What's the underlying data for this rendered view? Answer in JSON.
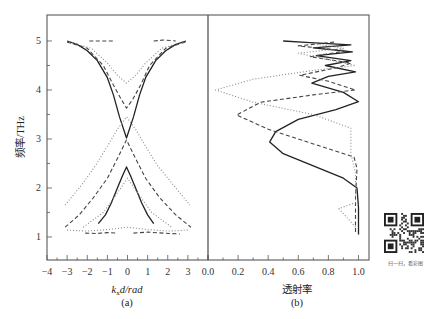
{
  "chart_data": [
    {
      "panel": "(a)",
      "type": "line",
      "title": "",
      "xlabel": "k_x d/rad",
      "xlabel_parts": {
        "k": "k",
        "sub": "x",
        "rest": "d/rad"
      },
      "ylabel": "频率/THz",
      "xlim": [
        -4,
        4
      ],
      "ylim": [
        0.53,
        5.53
      ],
      "x_ticks": [
        -4,
        -3,
        -2,
        -1,
        0,
        1,
        2,
        3
      ],
      "x_tick_labels": [
        "−4",
        "−3",
        "−2",
        "−1",
        "0",
        "1",
        "2",
        "3"
      ],
      "y_ticks": [
        1,
        2,
        3,
        4,
        5
      ],
      "y_tick_labels": [
        "1",
        "2",
        "3",
        "4",
        "5"
      ],
      "grid": false,
      "legend": null,
      "series": [
        {
          "name": "solid-upper-band",
          "style": "solid",
          "points": [
            [
              -3.0,
              5.0
            ],
            [
              -2.5,
              4.93
            ],
            [
              -2.0,
              4.8
            ],
            [
              -1.5,
              4.6
            ],
            [
              -1.0,
              4.25
            ],
            [
              -0.7,
              3.9
            ],
            [
              -0.4,
              3.45
            ],
            [
              -0.05,
              3.02
            ],
            [
              0.3,
              3.45
            ],
            [
              0.6,
              3.9
            ],
            [
              0.9,
              4.25
            ],
            [
              1.4,
              4.6
            ],
            [
              1.9,
              4.8
            ],
            [
              2.4,
              4.93
            ],
            [
              2.9,
              5.0
            ]
          ]
        },
        {
          "name": "solid-lower-band",
          "style": "solid",
          "points": [
            [
              -1.45,
              1.27
            ],
            [
              -1.1,
              1.45
            ],
            [
              -0.8,
              1.7
            ],
            [
              -0.5,
              2.0
            ],
            [
              -0.25,
              2.25
            ],
            [
              -0.05,
              2.43
            ],
            [
              0.15,
              2.25
            ],
            [
              0.4,
              2.0
            ],
            [
              0.7,
              1.7
            ],
            [
              1.0,
              1.45
            ],
            [
              1.3,
              1.27
            ]
          ]
        },
        {
          "name": "dashed-upper-band",
          "style": "dashed",
          "points": [
            [
              -3.0,
              4.98
            ],
            [
              -2.0,
              4.85
            ],
            [
              -1.2,
              4.5
            ],
            [
              -0.7,
              4.1
            ],
            [
              -0.3,
              3.8
            ],
            [
              -0.05,
              3.63
            ],
            [
              0.25,
              3.8
            ],
            [
              0.65,
              4.1
            ],
            [
              1.1,
              4.5
            ],
            [
              1.9,
              4.85
            ],
            [
              2.9,
              4.98
            ]
          ]
        },
        {
          "name": "dashed-lower-band",
          "style": "dashed",
          "points": [
            [
              -3.1,
              1.2
            ],
            [
              -2.4,
              1.45
            ],
            [
              -1.7,
              1.8
            ],
            [
              -1.0,
              2.2
            ],
            [
              -0.5,
              2.6
            ],
            [
              -0.05,
              2.98
            ],
            [
              0.4,
              2.6
            ],
            [
              0.9,
              2.2
            ],
            [
              1.6,
              1.8
            ],
            [
              2.4,
              1.45
            ],
            [
              3.15,
              1.2
            ]
          ]
        },
        {
          "name": "dotted-upper-band",
          "style": "dotted",
          "points": [
            [
              -2.9,
              4.98
            ],
            [
              -1.8,
              4.85
            ],
            [
              -1.0,
              4.55
            ],
            [
              -0.5,
              4.3
            ],
            [
              -0.05,
              4.14
            ],
            [
              0.4,
              4.3
            ],
            [
              0.9,
              4.55
            ],
            [
              1.7,
              4.85
            ],
            [
              2.8,
              4.98
            ]
          ]
        },
        {
          "name": "dotted-lower-band",
          "style": "dotted",
          "points": [
            [
              -3.1,
              1.65
            ],
            [
              -2.3,
              2.05
            ],
            [
              -1.6,
              2.45
            ],
            [
              -1.0,
              2.85
            ],
            [
              -0.5,
              3.2
            ],
            [
              -0.05,
              3.45
            ],
            [
              0.4,
              3.2
            ],
            [
              0.9,
              2.85
            ],
            [
              1.5,
              2.45
            ],
            [
              2.3,
              2.05
            ],
            [
              3.1,
              1.65
            ]
          ]
        },
        {
          "name": "dotted-crossing",
          "style": "dotted",
          "points": [
            [
              -2.2,
              1.2
            ],
            [
              -1.2,
              1.5
            ],
            [
              -0.5,
              1.9
            ],
            [
              0.0,
              2.2
            ],
            [
              0.5,
              1.9
            ],
            [
              1.2,
              1.5
            ],
            [
              2.2,
              1.2
            ]
          ]
        },
        {
          "name": "floor-dashed-left",
          "style": "dashed",
          "points": [
            [
              -2.1,
              1.08
            ],
            [
              -1.5,
              1.07
            ],
            [
              -1.0,
              1.09
            ],
            [
              -0.5,
              1.08
            ]
          ]
        },
        {
          "name": "floor-dashed-right",
          "style": "dashed",
          "points": [
            [
              0.3,
              1.08
            ],
            [
              1.0,
              1.1
            ],
            [
              1.8,
              1.08
            ],
            [
              2.6,
              1.06
            ]
          ]
        },
        {
          "name": "floor-dotted",
          "style": "dotted",
          "points": [
            [
              -3.0,
              1.14
            ],
            [
              -2.0,
              1.12
            ],
            [
              -1.0,
              1.15
            ],
            [
              0.0,
              1.2
            ],
            [
              1.0,
              1.15
            ],
            [
              2.0,
              1.12
            ],
            [
              3.0,
              1.14
            ]
          ]
        },
        {
          "name": "top-flat-left",
          "style": "dashed",
          "points": [
            [
              -1.9,
              5.0
            ],
            [
              -0.6,
              5.0
            ]
          ]
        },
        {
          "name": "top-flat-right",
          "style": "dashed",
          "points": [
            [
              1.3,
              5.0
            ],
            [
              1.8,
              5.02
            ],
            [
              2.4,
              5.0
            ]
          ]
        }
      ]
    },
    {
      "panel": "(b)",
      "type": "line",
      "title": "",
      "xlabel": "透射率",
      "ylabel": "",
      "xlim": [
        0.0,
        1.07
      ],
      "ylim": [
        0.53,
        5.53
      ],
      "x_ticks": [
        0.0,
        0.2,
        0.4,
        0.6,
        0.8,
        1.0
      ],
      "x_tick_labels": [
        "0.0",
        "0.2",
        "0.4",
        "0.6",
        "0.8",
        "1.0"
      ],
      "grid": false,
      "legend": null,
      "series": [
        {
          "name": "solid-transmission",
          "style": "solid",
          "points": [
            [
              1.0,
              1.05
            ],
            [
              1.0,
              1.6
            ],
            [
              0.99,
              2.0
            ],
            [
              0.9,
              2.2
            ],
            [
              0.7,
              2.45
            ],
            [
              0.5,
              2.7
            ],
            [
              0.41,
              2.94
            ],
            [
              0.45,
              3.15
            ],
            [
              0.6,
              3.4
            ],
            [
              0.85,
              3.6
            ],
            [
              1.0,
              3.76
            ],
            [
              0.9,
              3.95
            ],
            [
              0.69,
              4.14
            ],
            [
              0.8,
              4.28
            ],
            [
              0.98,
              4.37
            ],
            [
              0.78,
              4.5
            ],
            [
              0.95,
              4.6
            ],
            [
              0.72,
              4.7
            ],
            [
              0.96,
              4.78
            ],
            [
              0.7,
              4.86
            ],
            [
              0.95,
              4.92
            ],
            [
              0.65,
              4.97
            ],
            [
              0.5,
              5.0
            ]
          ]
        },
        {
          "name": "dashed-transmission",
          "style": "dashed",
          "points": [
            [
              0.98,
              1.1
            ],
            [
              0.98,
              1.8
            ],
            [
              0.99,
              2.4
            ],
            [
              0.97,
              2.63
            ],
            [
              0.7,
              2.9
            ],
            [
              0.4,
              3.2
            ],
            [
              0.19,
              3.49
            ],
            [
              0.35,
              3.75
            ],
            [
              0.7,
              3.9
            ],
            [
              0.98,
              4.0
            ],
            [
              0.8,
              4.18
            ],
            [
              0.61,
              4.3
            ],
            [
              0.85,
              4.45
            ],
            [
              0.95,
              4.55
            ],
            [
              0.68,
              4.68
            ],
            [
              0.92,
              4.8
            ],
            [
              0.6,
              4.9
            ],
            [
              0.85,
              4.98
            ]
          ]
        },
        {
          "name": "dotted-transmission",
          "style": "dotted",
          "points": [
            [
              0.98,
              1.2
            ],
            [
              0.87,
              1.58
            ],
            [
              0.98,
              1.7
            ],
            [
              0.98,
              2.3
            ],
            [
              0.95,
              2.7
            ],
            [
              0.95,
              3.22
            ],
            [
              0.7,
              3.5
            ],
            [
              0.3,
              3.75
            ],
            [
              0.05,
              4.0
            ],
            [
              0.3,
              4.22
            ],
            [
              0.7,
              4.4
            ],
            [
              0.98,
              4.5
            ],
            [
              0.8,
              4.62
            ],
            [
              0.6,
              4.75
            ],
            [
              0.9,
              4.85
            ],
            [
              0.7,
              4.95
            ]
          ]
        }
      ]
    }
  ],
  "figure": {
    "ylabel": "频率/THz",
    "panel_a_label": "(a)",
    "panel_b_label": "(b)",
    "panel_b_xlabel": "透射率",
    "panel_a_xlabel_k": "k",
    "panel_a_xlabel_sub": "x",
    "panel_a_xlabel_rest": "d/rad"
  },
  "qr": {
    "caption": "扫一扫，看彩图"
  }
}
